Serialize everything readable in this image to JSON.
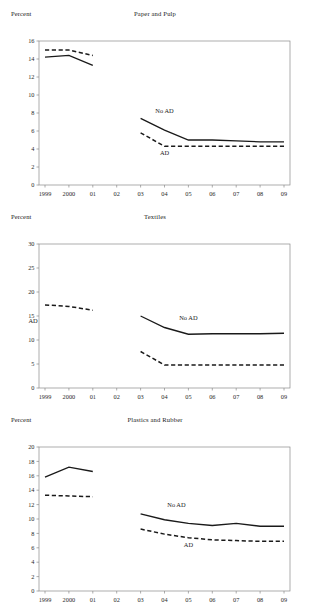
{
  "figure": {
    "background": "#ffffff",
    "ink": "#1a1a1a",
    "axis_color": "#8a8a8a",
    "top_note": "",
    "bottom_note": ""
  },
  "axis_label": "Percent",
  "series_names": {
    "solid": "No AD",
    "dashed": "AD"
  },
  "x_categories": [
    "1999",
    "2000",
    "01",
    "02",
    "03",
    "04",
    "05",
    "06",
    "07",
    "08",
    "09"
  ],
  "chart_data": [
    {
      "type": "line",
      "title": "Paper and Pulp",
      "ylabel": "Percent",
      "xlabel": "",
      "grid": false,
      "legend": "inline-annotation",
      "x": [
        "1999",
        "2000",
        "01",
        "02",
        "03",
        "04",
        "05",
        "06",
        "07",
        "08",
        "09"
      ],
      "ylim": [
        0,
        16
      ],
      "yticks": [
        0,
        2,
        4,
        6,
        8,
        10,
        12,
        14,
        16
      ],
      "series": [
        {
          "name": "No AD",
          "style": "solid",
          "label_x": "04",
          "label_y": 8.0,
          "points": [
            {
              "x": "1999",
              "y": 14.2
            },
            {
              "x": "2000",
              "y": 14.4
            },
            {
              "x": "01",
              "y": 13.3
            },
            {
              "x": "03",
              "y": 7.4
            },
            {
              "x": "04",
              "y": 6.1
            },
            {
              "x": "05",
              "y": 5.0
            },
            {
              "x": "06",
              "y": 5.0
            },
            {
              "x": "07",
              "y": 4.9
            },
            {
              "x": "08",
              "y": 4.8
            },
            {
              "x": "09",
              "y": 4.8
            }
          ]
        },
        {
          "name": "AD",
          "style": "dashed",
          "label_x": "04",
          "label_y": 3.3,
          "points": [
            {
              "x": "1999",
              "y": 15.0
            },
            {
              "x": "2000",
              "y": 15.0
            },
            {
              "x": "01",
              "y": 14.4
            },
            {
              "x": "03",
              "y": 5.8
            },
            {
              "x": "04",
              "y": 4.3
            },
            {
              "x": "05",
              "y": 4.3
            },
            {
              "x": "06",
              "y": 4.3
            },
            {
              "x": "07",
              "y": 4.3
            },
            {
              "x": "08",
              "y": 4.3
            },
            {
              "x": "09",
              "y": 4.3
            }
          ]
        }
      ]
    },
    {
      "type": "line",
      "title": "Textiles",
      "ylabel": "Percent",
      "xlabel": "",
      "grid": false,
      "legend": "inline-annotation",
      "x": [
        "1999",
        "2000",
        "01",
        "02",
        "03",
        "04",
        "05",
        "06",
        "07",
        "08",
        "09"
      ],
      "ylim": [
        0,
        30
      ],
      "yticks": [
        0,
        5,
        10,
        15,
        20,
        25,
        30
      ],
      "series": [
        {
          "name": "No AD",
          "style": "solid",
          "label_x": "05",
          "label_y": 14.2,
          "points": [
            {
              "x": "1999",
              "y": 24.7
            },
            {
              "x": "01",
              "y": 21.0
            },
            {
              "x": "03",
              "y": 15.0
            },
            {
              "x": "04",
              "y": 12.6
            },
            {
              "x": "05",
              "y": 11.2
            },
            {
              "x": "06",
              "y": 11.3
            },
            {
              "x": "07",
              "y": 11.3
            },
            {
              "x": "08",
              "y": 11.3
            },
            {
              "x": "09",
              "y": 11.4
            }
          ]
        },
        {
          "name": "AD",
          "style": "dashed",
          "label_x": "00.5",
          "label_y": 13.6,
          "points": [
            {
              "x": "1999",
              "y": 17.3
            },
            {
              "x": "2000",
              "y": 17.0
            },
            {
              "x": "01",
              "y": 16.2
            },
            {
              "x": "03",
              "y": 7.6
            },
            {
              "x": "04",
              "y": 4.8
            },
            {
              "x": "05",
              "y": 4.8
            },
            {
              "x": "06",
              "y": 4.8
            },
            {
              "x": "07",
              "y": 4.8
            },
            {
              "x": "08",
              "y": 4.8
            },
            {
              "x": "09",
              "y": 4.8
            }
          ]
        }
      ]
    },
    {
      "type": "line",
      "title": "Plastics and Rubber",
      "ylabel": "Percent",
      "xlabel": "",
      "grid": false,
      "legend": "inline-annotation",
      "x": [
        "1999",
        "2000",
        "01",
        "02",
        "03",
        "04",
        "05",
        "06",
        "07",
        "08",
        "09"
      ],
      "ylim": [
        0,
        20
      ],
      "yticks": [
        0,
        2,
        4,
        6,
        8,
        10,
        12,
        14,
        16,
        18,
        20
      ],
      "series": [
        {
          "name": "No AD",
          "style": "solid",
          "label_x": "04.5",
          "label_y": 11.6,
          "points": [
            {
              "x": "1999",
              "y": 15.8
            },
            {
              "x": "2000",
              "y": 17.2
            },
            {
              "x": "01",
              "y": 16.6
            },
            {
              "x": "03",
              "y": 10.7
            },
            {
              "x": "04",
              "y": 9.9
            },
            {
              "x": "05",
              "y": 9.4
            },
            {
              "x": "06",
              "y": 9.1
            },
            {
              "x": "07",
              "y": 9.4
            },
            {
              "x": "08",
              "y": 9.0
            },
            {
              "x": "09",
              "y": 9.0
            }
          ]
        },
        {
          "name": "AD",
          "style": "dashed",
          "label_x": "05",
          "label_y": 6.1,
          "points": [
            {
              "x": "1999",
              "y": 13.3
            },
            {
              "x": "2000",
              "y": 13.2
            },
            {
              "x": "01",
              "y": 13.1
            },
            {
              "x": "03",
              "y": 8.6
            },
            {
              "x": "04",
              "y": 7.9
            },
            {
              "x": "05",
              "y": 7.4
            },
            {
              "x": "06",
              "y": 7.1
            },
            {
              "x": "07",
              "y": 7.0
            },
            {
              "x": "08",
              "y": 6.9
            },
            {
              "x": "09",
              "y": 6.9
            }
          ]
        }
      ]
    }
  ]
}
